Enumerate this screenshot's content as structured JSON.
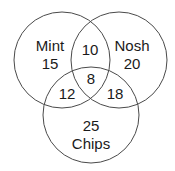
{
  "diagram": {
    "type": "venn",
    "sets": [
      {
        "name": "Mint",
        "only": "15"
      },
      {
        "name": "Nosh",
        "only": "20"
      },
      {
        "name": "Chips",
        "only": "25"
      }
    ],
    "regions": {
      "mint_only": "15",
      "nosh_only": "20",
      "chips_only": "25",
      "mint_nosh": "10",
      "mint_chips": "12",
      "nosh_chips": "18",
      "all_three": "8"
    },
    "labels": {
      "mint": "Mint",
      "nosh": "Nosh",
      "chips": "Chips"
    },
    "colors": {
      "stroke": "#4a4a4a",
      "text": "#1a1a1a",
      "background": "#ffffff"
    }
  }
}
